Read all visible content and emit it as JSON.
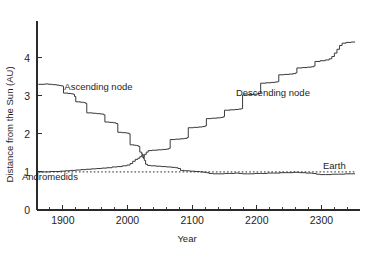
{
  "chart_data": {
    "type": "line",
    "title": "",
    "xlabel": "Year",
    "ylabel": "Distance from the Sun (AU)",
    "xlim": [
      1860,
      2355
    ],
    "ylim": [
      0,
      4.7
    ],
    "xticks": [
      1900,
      2000,
      2100,
      2200,
      2300
    ],
    "xticklabels": [
      "1900",
      "2000",
      "2100",
      "2200",
      "2300"
    ],
    "xminor_step": 20,
    "yticks": [
      0,
      1,
      2,
      3,
      4
    ],
    "yticklabels": [
      "0",
      "1",
      "2",
      "3",
      "4"
    ],
    "grid": false,
    "legend": "none",
    "annotations": [
      {
        "text": "Ascending node",
        "x": 1955,
        "y": 3.15
      },
      {
        "text": "Descending node",
        "x": 2225,
        "y": 3.0
      },
      {
        "text": "Andromedids",
        "x": 1880,
        "y": 0.8
      },
      {
        "text": "Earth",
        "x": 2320,
        "y": 1.07
      }
    ],
    "series": [
      {
        "name": "Ascending node",
        "style": "solid-step",
        "points": [
          [
            1862,
            3.3
          ],
          [
            1872,
            3.31
          ],
          [
            1878,
            3.3
          ],
          [
            1884,
            3.29
          ],
          [
            1890,
            3.28
          ],
          [
            1894,
            3.27
          ],
          [
            1897,
            3.26
          ],
          [
            1900,
            3.25
          ],
          [
            1901,
            3.07
          ],
          [
            1908,
            3.06
          ],
          [
            1913,
            3.05
          ],
          [
            1916,
            3.04
          ],
          [
            1918,
            2.98
          ],
          [
            1920,
            2.84
          ],
          [
            1927,
            2.83
          ],
          [
            1932,
            2.82
          ],
          [
            1935,
            2.8
          ],
          [
            1937,
            2.55
          ],
          [
            1946,
            2.54
          ],
          [
            1952,
            2.53
          ],
          [
            1958,
            2.52
          ],
          [
            1963,
            2.5
          ],
          [
            1965,
            2.31
          ],
          [
            1972,
            2.3
          ],
          [
            1978,
            2.29
          ],
          [
            1982,
            2.27
          ],
          [
            1985,
            2.04
          ],
          [
            1992,
            2.03
          ],
          [
            1998,
            2.02
          ],
          [
            2002,
            2.0
          ],
          [
            2004,
            1.71
          ],
          [
            2010,
            1.7
          ],
          [
            2014,
            1.69
          ],
          [
            2017,
            1.67
          ],
          [
            2019,
            1.52
          ],
          [
            2022,
            1.47
          ],
          [
            2024,
            1.36
          ],
          [
            2026,
            1.3
          ],
          [
            2028,
            1.2
          ],
          [
            2031,
            1.17
          ],
          [
            2036,
            1.16
          ],
          [
            2044,
            1.15
          ],
          [
            2052,
            1.14
          ],
          [
            2060,
            1.13
          ],
          [
            2068,
            1.12
          ],
          [
            2074,
            1.11
          ],
          [
            2078,
            1.09
          ],
          [
            2082,
            1.04
          ],
          [
            2088,
            1.03
          ],
          [
            2096,
            1.02
          ],
          [
            2104,
            1.01
          ],
          [
            2112,
            1.0
          ],
          [
            2118,
            0.99
          ],
          [
            2122,
            0.98
          ],
          [
            2126,
            0.96
          ],
          [
            2132,
            0.95
          ],
          [
            2140,
            0.95
          ],
          [
            2150,
            0.96
          ],
          [
            2158,
            0.96
          ],
          [
            2166,
            0.97
          ],
          [
            2172,
            0.96
          ],
          [
            2178,
            0.95
          ],
          [
            2186,
            0.95
          ],
          [
            2196,
            0.96
          ],
          [
            2206,
            0.96
          ],
          [
            2216,
            0.97
          ],
          [
            2226,
            0.97
          ],
          [
            2236,
            0.98
          ],
          [
            2246,
            0.98
          ],
          [
            2256,
            0.99
          ],
          [
            2266,
            0.98
          ],
          [
            2276,
            0.97
          ],
          [
            2286,
            0.96
          ],
          [
            2292,
            0.94
          ],
          [
            2298,
            0.93
          ],
          [
            2306,
            0.93
          ],
          [
            2316,
            0.94
          ],
          [
            2326,
            0.94
          ],
          [
            2336,
            0.95
          ],
          [
            2346,
            0.95
          ],
          [
            2352,
            0.95
          ]
        ]
      },
      {
        "name": "Descending node",
        "style": "solid-step",
        "points": [
          [
            1862,
            1.0
          ],
          [
            1872,
            1.0
          ],
          [
            1880,
            1.01
          ],
          [
            1888,
            1.01
          ],
          [
            1896,
            1.02
          ],
          [
            1904,
            1.03
          ],
          [
            1912,
            1.04
          ],
          [
            1920,
            1.05
          ],
          [
            1928,
            1.06
          ],
          [
            1936,
            1.07
          ],
          [
            1944,
            1.08
          ],
          [
            1952,
            1.09
          ],
          [
            1960,
            1.1
          ],
          [
            1968,
            1.11
          ],
          [
            1976,
            1.13
          ],
          [
            1984,
            1.14
          ],
          [
            1992,
            1.16
          ],
          [
            1999,
            1.18
          ],
          [
            2004,
            1.22
          ],
          [
            2008,
            1.28
          ],
          [
            2012,
            1.33
          ],
          [
            2016,
            1.36
          ],
          [
            2019,
            1.4
          ],
          [
            2022,
            1.45
          ],
          [
            2024,
            1.38
          ],
          [
            2026,
            1.46
          ],
          [
            2029,
            1.52
          ],
          [
            2032,
            1.56
          ],
          [
            2038,
            1.57
          ],
          [
            2046,
            1.58
          ],
          [
            2054,
            1.59
          ],
          [
            2060,
            1.6
          ],
          [
            2064,
            1.62
          ],
          [
            2066,
            1.85
          ],
          [
            2074,
            1.86
          ],
          [
            2082,
            1.87
          ],
          [
            2088,
            1.88
          ],
          [
            2092,
            1.9
          ],
          [
            2094,
            2.16
          ],
          [
            2102,
            2.17
          ],
          [
            2110,
            2.18
          ],
          [
            2116,
            2.19
          ],
          [
            2120,
            2.21
          ],
          [
            2122,
            2.4
          ],
          [
            2130,
            2.41
          ],
          [
            2138,
            2.42
          ],
          [
            2144,
            2.43
          ],
          [
            2148,
            2.45
          ],
          [
            2150,
            2.62
          ],
          [
            2158,
            2.63
          ],
          [
            2166,
            2.64
          ],
          [
            2172,
            2.65
          ],
          [
            2176,
            2.66
          ],
          [
            2178,
            3.02
          ],
          [
            2186,
            3.03
          ],
          [
            2194,
            3.04
          ],
          [
            2200,
            3.05
          ],
          [
            2204,
            3.06
          ],
          [
            2206,
            3.33
          ],
          [
            2214,
            3.34
          ],
          [
            2222,
            3.35
          ],
          [
            2228,
            3.36
          ],
          [
            2232,
            3.37
          ],
          [
            2234,
            3.55
          ],
          [
            2242,
            3.56
          ],
          [
            2250,
            3.57
          ],
          [
            2256,
            3.58
          ],
          [
            2260,
            3.6
          ],
          [
            2262,
            3.73
          ],
          [
            2270,
            3.74
          ],
          [
            2278,
            3.75
          ],
          [
            2284,
            3.76
          ],
          [
            2288,
            3.78
          ],
          [
            2290,
            3.9
          ],
          [
            2298,
            3.92
          ],
          [
            2306,
            3.94
          ],
          [
            2312,
            3.97
          ],
          [
            2316,
            4.03
          ],
          [
            2320,
            4.12
          ],
          [
            2324,
            4.22
          ],
          [
            2328,
            4.32
          ],
          [
            2332,
            4.38
          ],
          [
            2338,
            4.4
          ],
          [
            2346,
            4.41
          ],
          [
            2352,
            4.41
          ]
        ]
      },
      {
        "name": "Earth",
        "style": "dotted",
        "points": [
          [
            1862,
            1.0
          ],
          [
            2352,
            1.0
          ]
        ]
      }
    ]
  }
}
